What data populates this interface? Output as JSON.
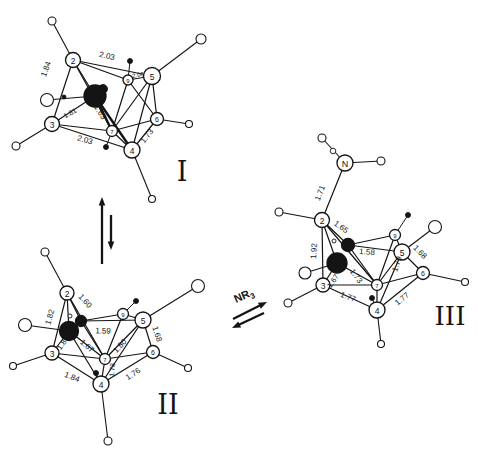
{
  "canvas": {
    "width": 478,
    "height": 456,
    "bg": "#ffffff",
    "ink": "#141414"
  },
  "figure_kind": "carborane-cluster-isomerization-scheme",
  "structures": [
    {
      "id": "I",
      "roman": {
        "text": "I",
        "x": 182,
        "y": 171,
        "size": 27
      },
      "atoms": [
        {
          "id": "2",
          "label": "2",
          "x": 73,
          "y": 60,
          "r": 7.5
        },
        {
          "id": "5",
          "label": "5",
          "x": 152,
          "y": 76,
          "r": 8.5
        },
        {
          "id": "9",
          "label": "9",
          "x": 128,
          "y": 80,
          "r": 5,
          "fs": 6
        },
        {
          "id": "C",
          "label": "",
          "x": 95,
          "y": 96,
          "r": 11,
          "filled": true
        },
        {
          "id": "3",
          "label": "3",
          "x": 52,
          "y": 124,
          "r": 7.5
        },
        {
          "id": "7",
          "label": "7",
          "x": 112,
          "y": 131,
          "r": 5.5,
          "fs": 6
        },
        {
          "id": "4",
          "label": "4",
          "x": 132,
          "y": 150,
          "r": 8
        },
        {
          "id": "6",
          "label": "6",
          "x": 157,
          "y": 119,
          "r": 6.5,
          "fs": 7
        }
      ],
      "bonds": [
        {
          "a": "2",
          "b": "5",
          "label": "2.03",
          "lx": 107,
          "ly": 56,
          "rot": 12
        },
        {
          "a": "2",
          "b": "9"
        },
        {
          "a": "2",
          "b": "C"
        },
        {
          "a": "2",
          "b": "3",
          "label": "1.84",
          "lx": 46,
          "ly": 69,
          "rot": -70
        },
        {
          "a": "2",
          "b": "7"
        },
        {
          "a": "C",
          "b": "3",
          "label": "1.81",
          "lx": 70,
          "ly": 113,
          "rot": -30,
          "fs": 7
        },
        {
          "a": "C",
          "b": "7",
          "label": "1.63",
          "lx": 100,
          "ly": 112,
          "rot": 58,
          "w": 2.4
        },
        {
          "a": "C",
          "b": "4",
          "w": 2.4
        },
        {
          "a": "3",
          "b": "7"
        },
        {
          "a": "3",
          "b": "4",
          "label": "2.03",
          "lx": 85,
          "ly": 140,
          "rot": 16
        },
        {
          "a": "7",
          "b": "4"
        },
        {
          "a": "7",
          "b": "9"
        },
        {
          "a": "9",
          "b": "5",
          "label": "2.06",
          "lx": 138,
          "ly": 75,
          "rot": -9,
          "fs": 6
        },
        {
          "a": "5",
          "b": "6"
        },
        {
          "a": "5",
          "b": "4"
        },
        {
          "a": "5",
          "b": "7"
        },
        {
          "a": "4",
          "b": "6",
          "label": "1.73",
          "lx": 147,
          "ly": 136,
          "rot": -52
        },
        {
          "a": "6",
          "b": "7"
        },
        {
          "a": "6",
          "b": "9"
        }
      ],
      "hydrogens": [
        {
          "at": "2",
          "x": 52,
          "y": 21,
          "r": 4
        },
        {
          "at": "5",
          "x": 201,
          "y": 39,
          "r": 5
        },
        {
          "at": "C",
          "x": 47,
          "y": 100,
          "r": 6.5
        },
        {
          "at": "3",
          "x": 16,
          "y": 146,
          "r": 4
        },
        {
          "at": "6",
          "x": 189,
          "y": 124,
          "r": 3.5
        },
        {
          "at": "4",
          "x": 152,
          "y": 199,
          "r": 3.5
        }
      ],
      "dots": [
        {
          "x": 130,
          "y": 61,
          "r": 2.5,
          "stem": "9"
        },
        {
          "x": 106,
          "y": 147,
          "r": 2.5,
          "stem": "7"
        },
        {
          "x": 64,
          "y": 97,
          "r": 2
        },
        {
          "x": 103,
          "y": 89,
          "r": 4.5
        }
      ]
    },
    {
      "id": "II",
      "roman": {
        "text": "II",
        "x": 168,
        "y": 404,
        "size": 27
      },
      "atoms": [
        {
          "id": "2",
          "label": "2",
          "x": 67,
          "y": 293,
          "r": 7
        },
        {
          "id": "C1",
          "label": "",
          "x": 81,
          "y": 321,
          "r": 5.5,
          "filled": true
        },
        {
          "id": "C2",
          "label": "",
          "x": 69,
          "y": 331,
          "r": 9.5,
          "filled": true
        },
        {
          "id": "3",
          "label": "3",
          "x": 52,
          "y": 353,
          "r": 7
        },
        {
          "id": "9",
          "label": "9",
          "x": 123,
          "y": 314,
          "r": 5.5,
          "fs": 6
        },
        {
          "id": "5",
          "label": "5",
          "x": 143,
          "y": 320,
          "r": 8
        },
        {
          "id": "7",
          "label": "7",
          "x": 105,
          "y": 359,
          "r": 5.5,
          "fs": 6
        },
        {
          "id": "4",
          "label": "4",
          "x": 101,
          "y": 384,
          "r": 8
        },
        {
          "id": "6",
          "label": "6",
          "x": 153,
          "y": 352,
          "r": 6.5,
          "fs": 7
        }
      ],
      "bonds": [
        {
          "a": "2",
          "b": "C1",
          "label": "1.60",
          "lx": 85,
          "ly": 301,
          "rot": 48
        },
        {
          "a": "2",
          "b": "C2"
        },
        {
          "a": "2",
          "b": "3",
          "label": "1.82",
          "lx": 50,
          "ly": 317,
          "rot": -74
        },
        {
          "a": "2",
          "b": "7"
        },
        {
          "a": "C1",
          "b": "9"
        },
        {
          "a": "C1",
          "b": "5",
          "label": "1.59",
          "lx": 103,
          "ly": 331,
          "rot": 2
        },
        {
          "a": "C1",
          "b": "7"
        },
        {
          "a": "C2",
          "b": "3",
          "label": "1.85",
          "lx": 63,
          "ly": 343,
          "rot": -55,
          "fs": 7.5
        },
        {
          "a": "C2",
          "b": "7",
          "label": "1.67",
          "lx": 87,
          "ly": 346,
          "rot": 42
        },
        {
          "a": "C2",
          "b": "4"
        },
        {
          "a": "3",
          "b": "7"
        },
        {
          "a": "3",
          "b": "4",
          "label": "1.84",
          "lx": 72,
          "ly": 377,
          "rot": 22
        },
        {
          "a": "7",
          "b": "4",
          "label": "1.78",
          "lx": 112,
          "ly": 370,
          "rot": -85,
          "fs": 7
        },
        {
          "a": "7",
          "b": "9"
        },
        {
          "a": "7",
          "b": "5",
          "label": "1.80",
          "lx": 120,
          "ly": 346,
          "rot": -47
        },
        {
          "a": "9",
          "b": "5"
        },
        {
          "a": "5",
          "b": "6",
          "label": "1.68",
          "lx": 157,
          "ly": 334,
          "rot": 72
        },
        {
          "a": "5",
          "b": "4"
        },
        {
          "a": "4",
          "b": "6",
          "label": "1.76",
          "lx": 133,
          "ly": 374,
          "rot": -33
        },
        {
          "a": "6",
          "b": "7"
        }
      ],
      "hydrogens": [
        {
          "at": "2",
          "x": 45,
          "y": 252,
          "r": 4
        },
        {
          "at": "C2",
          "x": 25,
          "y": 325,
          "r": 6.5
        },
        {
          "at": "3",
          "x": 13,
          "y": 366,
          "r": 3.5
        },
        {
          "at": "5",
          "x": 198,
          "y": 286,
          "r": 6.5
        },
        {
          "at": "6",
          "x": 188,
          "y": 368,
          "r": 3.5
        },
        {
          "at": "4",
          "x": 108,
          "y": 441,
          "r": 4
        }
      ],
      "dots": [
        {
          "x": 136,
          "y": 301,
          "r": 2.5,
          "stem": "9"
        },
        {
          "x": 96,
          "y": 373,
          "r": 2.5,
          "stem": "4"
        },
        {
          "x": 70,
          "y": 316,
          "r": 2,
          "open": true
        }
      ]
    },
    {
      "id": "III",
      "roman": {
        "text": "III",
        "x": 450,
        "y": 316,
        "size": 26
      },
      "atoms": [
        {
          "id": "N",
          "label": "N",
          "x": 345,
          "y": 163,
          "r": 8,
          "fs": 9
        },
        {
          "id": "2",
          "label": "2",
          "x": 322,
          "y": 220,
          "r": 7.5
        },
        {
          "id": "C1",
          "label": "",
          "x": 348,
          "y": 245,
          "r": 6.5,
          "filled": true
        },
        {
          "id": "C2",
          "label": "",
          "x": 337,
          "y": 263,
          "r": 10,
          "filled": true
        },
        {
          "id": "3",
          "label": "3",
          "x": 323,
          "y": 285,
          "r": 7
        },
        {
          "id": "9",
          "label": "9",
          "x": 395,
          "y": 235,
          "r": 5.5,
          "fs": 6
        },
        {
          "id": "5",
          "label": "5",
          "x": 402,
          "y": 252,
          "r": 8
        },
        {
          "id": "7",
          "label": "7",
          "x": 377,
          "y": 285,
          "r": 5.5,
          "fs": 6
        },
        {
          "id": "4",
          "label": "4",
          "x": 377,
          "y": 310,
          "r": 8
        },
        {
          "id": "6",
          "label": "6",
          "x": 423,
          "y": 273,
          "r": 6.5,
          "fs": 7
        }
      ],
      "bonds": [
        {
          "a": "N",
          "b": "2",
          "label": "1.71",
          "lx": 320,
          "ly": 193,
          "rot": -68
        },
        {
          "a": "2",
          "b": "C1",
          "label": "1.65",
          "lx": 341,
          "ly": 227,
          "rot": 36
        },
        {
          "a": "2",
          "b": "C2"
        },
        {
          "a": "2",
          "b": "3",
          "label": "1.92",
          "lx": 314,
          "ly": 251,
          "rot": -87
        },
        {
          "a": "2",
          "b": "7"
        },
        {
          "a": "C1",
          "b": "5",
          "label": "1.58",
          "lx": 367,
          "ly": 252,
          "rot": 4
        },
        {
          "a": "C1",
          "b": "7",
          "label": "1.73",
          "lx": 356,
          "ly": 276,
          "rot": 54
        },
        {
          "a": "C1",
          "b": "9"
        },
        {
          "a": "C2",
          "b": "3",
          "label": "1.67",
          "lx": 333,
          "ly": 281,
          "rot": -55,
          "fs": 7.5
        },
        {
          "a": "C2",
          "b": "7"
        },
        {
          "a": "3",
          "b": "7"
        },
        {
          "a": "3",
          "b": "4",
          "label": "1.77",
          "lx": 348,
          "ly": 297,
          "rot": 22
        },
        {
          "a": "7",
          "b": "4"
        },
        {
          "a": "7",
          "b": "9"
        },
        {
          "a": "5",
          "b": "7"
        },
        {
          "a": "5",
          "b": "4",
          "label": "1.79",
          "lx": 397,
          "ly": 264,
          "rot": -72
        },
        {
          "a": "9",
          "b": "5"
        },
        {
          "a": "5",
          "b": "6",
          "label": "1.68",
          "lx": 420,
          "ly": 252,
          "rot": 45
        },
        {
          "a": "4",
          "b": "6",
          "label": "1.77",
          "lx": 402,
          "ly": 299,
          "rot": -39
        },
        {
          "a": "6",
          "b": "7"
        }
      ],
      "hydrogens": [
        {
          "at": "N",
          "x": 322,
          "y": 138,
          "r": 4
        },
        {
          "at": "N",
          "x": 381,
          "y": 161,
          "r": 4
        },
        {
          "at": "2",
          "x": 279,
          "y": 212,
          "r": 4
        },
        {
          "at": "C2",
          "x": 305,
          "y": 273,
          "r": 6
        },
        {
          "at": "3",
          "x": 288,
          "y": 303,
          "r": 4
        },
        {
          "at": "5",
          "x": 435,
          "y": 227,
          "r": 6.5
        },
        {
          "at": "6",
          "x": 465,
          "y": 282,
          "r": 3.5
        },
        {
          "at": "4",
          "x": 381,
          "y": 344,
          "r": 3.5
        }
      ],
      "dots": [
        {
          "x": 333,
          "y": 151,
          "r": 2.8,
          "open": true
        },
        {
          "x": 408,
          "y": 215,
          "r": 2.5,
          "stem": "9"
        },
        {
          "x": 372,
          "y": 298,
          "r": 2.5,
          "stem": "4"
        },
        {
          "x": 334,
          "y": 241,
          "r": 2,
          "open": true
        }
      ]
    }
  ],
  "arrows": {
    "vertical_pair": [
      {
        "x1": 102,
        "y1": 264,
        "x2": 102,
        "y2": 197
      },
      {
        "x1": 111,
        "y1": 215,
        "x2": 111,
        "y2": 250
      }
    ],
    "horizontal_pair": [
      {
        "x1": 233,
        "y1": 319,
        "x2": 267,
        "y2": 302
      },
      {
        "x1": 264,
        "y1": 313,
        "x2": 232,
        "y2": 328
      }
    ]
  },
  "reagent": {
    "text": "NR",
    "subscript": "3",
    "x": 236,
    "y": 303,
    "rot": -24,
    "font_size": 11
  }
}
